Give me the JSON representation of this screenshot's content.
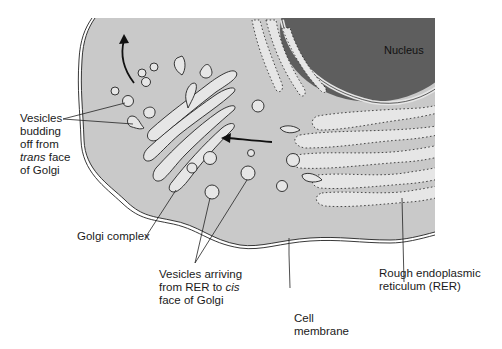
{
  "diagram": {
    "type": "cell cross-section: Golgi complex and rough endoplasmic reticulum",
    "colors": {
      "cytoplasm": "#c9c9c9",
      "nucleus": "#5e5e5e",
      "organelle_lumen": "#e6e6e6",
      "outline": "#222222",
      "background": "#ffffff"
    },
    "labels": {
      "nucleus": "Nucleus",
      "vesicles_budding": {
        "line1": "Vesicles",
        "line2": "budding",
        "line3": "off from",
        "line4_italic": "trans",
        "line4_rest": " face",
        "line5": "of Golgi"
      },
      "golgi_complex": "Golgi complex",
      "vesicles_arriving": {
        "line1": "Vesicles arriving",
        "line2_pre": "from RER to ",
        "line2_italic": "cis",
        "line3": "face of Golgi"
      },
      "cell_membrane": {
        "line1": "Cell",
        "line2": "membrane"
      },
      "rer": {
        "line1": "Rough endoplasmic",
        "line2": "reticulum (RER)"
      }
    },
    "arrows": [
      {
        "name": "exit-arrow",
        "direction": "up, away from Golgi trans face"
      },
      {
        "name": "transport-arrow",
        "direction": "left, from RER toward Golgi cis face"
      }
    ]
  }
}
